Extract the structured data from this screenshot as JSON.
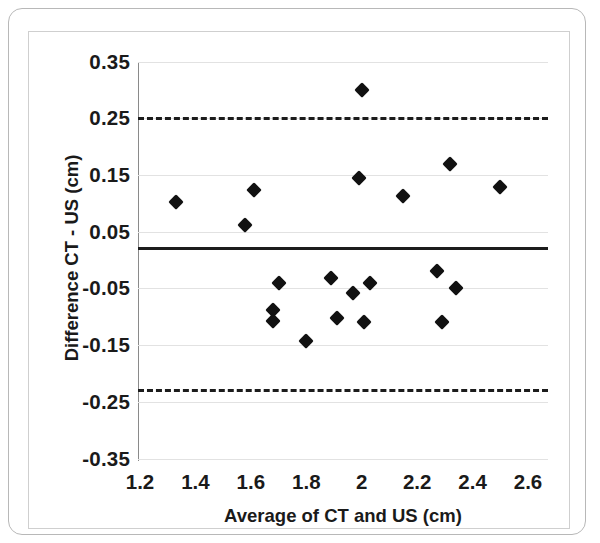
{
  "chart_data": {
    "type": "scatter",
    "title": "",
    "xlabel": "Average of CT and US (cm)",
    "ylabel": "Difference CT - US (cm)",
    "xlim": [
      1.1,
      2.65
    ],
    "ylim": [
      -0.35,
      0.35
    ],
    "xticks": [
      "1.2",
      "1.4",
      "1.6",
      "1.8",
      "2",
      "2.2",
      "2.4",
      "2.6"
    ],
    "xtick_values": [
      1.2,
      1.4,
      1.6,
      1.8,
      2.0,
      2.2,
      2.4,
      2.6
    ],
    "yticks": [
      "0.35",
      "0.25",
      "0.15",
      "0.05",
      "-0.05",
      "-0.15",
      "-0.25",
      "-0.35"
    ],
    "ytick_values": [
      0.35,
      0.25,
      0.15,
      0.05,
      -0.05,
      -0.15,
      -0.25,
      -0.35
    ],
    "grid": true,
    "legend": "none",
    "marker": "diamond",
    "marker_color": "#111111",
    "reference_lines": [
      {
        "name": "upper-limit-of-agreement",
        "value": 0.252,
        "style": "dashed",
        "color": "#1c1c1c"
      },
      {
        "name": "mean-difference",
        "value": 0.02,
        "style": "solid",
        "color": "#1c1c1c"
      },
      {
        "name": "lower-limit-of-agreement",
        "value": -0.228,
        "style": "dashed",
        "color": "#1c1c1c"
      }
    ],
    "points": [
      {
        "x": 1.33,
        "y": 0.103
      },
      {
        "x": 1.58,
        "y": 0.062
      },
      {
        "x": 1.61,
        "y": 0.124
      },
      {
        "x": 1.7,
        "y": -0.041
      },
      {
        "x": 1.68,
        "y": -0.089
      },
      {
        "x": 1.68,
        "y": -0.107
      },
      {
        "x": 1.8,
        "y": -0.142
      },
      {
        "x": 1.89,
        "y": -0.032
      },
      {
        "x": 1.91,
        "y": -0.103
      },
      {
        "x": 1.97,
        "y": -0.059
      },
      {
        "x": 1.99,
        "y": 0.145
      },
      {
        "x": 2.0,
        "y": 0.299
      },
      {
        "x": 2.01,
        "y": -0.11
      },
      {
        "x": 2.03,
        "y": -0.041
      },
      {
        "x": 2.15,
        "y": 0.112
      },
      {
        "x": 2.27,
        "y": -0.02
      },
      {
        "x": 2.29,
        "y": -0.11
      },
      {
        "x": 2.32,
        "y": 0.17
      },
      {
        "x": 2.34,
        "y": -0.05
      },
      {
        "x": 2.5,
        "y": 0.128
      }
    ]
  }
}
